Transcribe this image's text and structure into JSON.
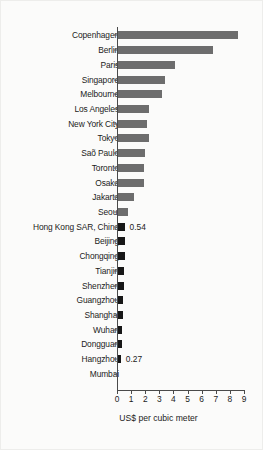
{
  "chart_data": {
    "type": "bar",
    "orientation": "horizontal",
    "title": "",
    "xlabel": "US$ per cubic meter",
    "ylabel": "",
    "xlim": [
      0,
      9
    ],
    "xticks": [
      0,
      1,
      2,
      3,
      4,
      5,
      6,
      7,
      8,
      9
    ],
    "grid": false,
    "legend": null,
    "colors": {
      "primary_gray": "#6d6d6d",
      "highlight_black": "#171717",
      "axis": "#4a4a4a",
      "text": "#1b1b1b",
      "background": "#fbfbfa"
    },
    "categories": [
      "Copenhagen",
      "Berlin",
      "Paris",
      "Singapore",
      "Melbourne",
      "Los Angeles",
      "New York City",
      "Tokyo",
      "Saõ Paulo",
      "Toronto",
      "Osaka",
      "Jakarta",
      "Seoul",
      "Hong Kong SAR, China",
      "Beijing",
      "Chongqing",
      "Tianjin",
      "Shenzhen",
      "Guangzhou",
      "Shanghai",
      "Wuhan",
      "Dongguan",
      "Hangzhou",
      "Mumbai"
    ],
    "values": [
      8.55,
      6.8,
      4.1,
      3.4,
      3.15,
      2.2,
      2.1,
      2.2,
      1.95,
      1.9,
      1.9,
      1.15,
      0.75,
      0.54,
      0.52,
      0.5,
      0.47,
      0.45,
      0.38,
      0.36,
      0.34,
      0.33,
      0.27,
      0.02
    ],
    "series_colors": [
      "gray",
      "gray",
      "gray",
      "gray",
      "gray",
      "gray",
      "gray",
      "gray",
      "gray",
      "gray",
      "gray",
      "gray",
      "gray",
      "black",
      "black",
      "black",
      "black",
      "black",
      "black",
      "black",
      "black",
      "black",
      "black",
      "black"
    ],
    "data_labels": {
      "13": "0.54",
      "22": "0.27"
    }
  }
}
